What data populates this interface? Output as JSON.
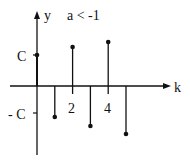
{
  "chart_data": {
    "type": "stem",
    "title": "a < -1",
    "xlabel": "k",
    "ylabel": "y",
    "x_ticks": [
      {
        "k": 2,
        "label": "2"
      },
      {
        "k": 4,
        "label": "4"
      }
    ],
    "y_ticks": [
      {
        "value": 1,
        "label": "C"
      },
      {
        "value": -1,
        "label": "- C"
      }
    ],
    "unit": "C",
    "x": [
      0,
      1,
      2,
      3,
      4,
      5
    ],
    "values": [
      1.0,
      -1.0,
      1.26,
      -1.29,
      1.42,
      -1.55
    ],
    "grid": false,
    "legend": null
  },
  "labels": {
    "y_axis": "y",
    "x_axis": "k",
    "condition": "a < -1",
    "c_pos": "C",
    "c_neg": "- C",
    "tick2": "2",
    "tick4": "4"
  },
  "colors": {
    "ink": "#111111",
    "background": "#ffffff"
  }
}
